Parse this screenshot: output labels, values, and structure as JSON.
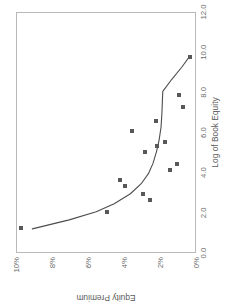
{
  "figure": {
    "orientation": "rotated-90-ccw",
    "background_color": "#ffffff",
    "frame_color": "#b9b9b9",
    "marker_color": "#585858",
    "line_color": "#4d4d4d"
  },
  "chart_data": {
    "type": "scatter",
    "title": "Smoothed Premium over CAPM vs. Unadjusted Premium over CAPM",
    "title_lines": [
      "Smoothed Premium over CAPM vs.",
      "Unadjusted Premium over CAPM"
    ],
    "xlabel": "Log of Book Equity",
    "ylabel": "Equity Premium",
    "xlim": [
      0.0,
      12.0
    ],
    "ylim": [
      0,
      10
    ],
    "xticks": [
      0.0,
      2.0,
      4.0,
      6.0,
      8.0,
      10.0,
      12.0
    ],
    "xtick_labels": [
      "0.0",
      "2.0",
      "4.0",
      "6.0",
      "8.0",
      "10.0",
      "12.0"
    ],
    "yticks": [
      0,
      2,
      4,
      6,
      8,
      10
    ],
    "ytick_labels": [
      "0%",
      "2%",
      "4%",
      "6%",
      "8%",
      "10%"
    ],
    "grid": false,
    "legend": null,
    "series": [
      {
        "name": "Unadjusted Premium over CAPM",
        "kind": "scatter",
        "marker": "square",
        "points": [
          {
            "x": 1.2,
            "y": 9.8
          },
          {
            "x": 2.0,
            "y": 5.0
          },
          {
            "x": 2.6,
            "y": 2.6
          },
          {
            "x": 2.9,
            "y": 3.0
          },
          {
            "x": 3.3,
            "y": 4.0
          },
          {
            "x": 3.6,
            "y": 4.3
          },
          {
            "x": 4.1,
            "y": 1.5
          },
          {
            "x": 4.4,
            "y": 1.1
          },
          {
            "x": 5.0,
            "y": 2.9
          },
          {
            "x": 5.3,
            "y": 2.2
          },
          {
            "x": 5.5,
            "y": 1.8
          },
          {
            "x": 6.0,
            "y": 3.6
          },
          {
            "x": 6.5,
            "y": 2.3
          },
          {
            "x": 7.2,
            "y": 0.8
          },
          {
            "x": 7.8,
            "y": 1.0
          },
          {
            "x": 9.7,
            "y": 0.4
          }
        ]
      },
      {
        "name": "Smoothed Premium over CAPM",
        "kind": "line",
        "points": [
          {
            "x": 1.15,
            "y": 9.15
          },
          {
            "x": 1.6,
            "y": 7.1
          },
          {
            "x": 2.0,
            "y": 5.6
          },
          {
            "x": 2.4,
            "y": 4.6
          },
          {
            "x": 2.9,
            "y": 3.7
          },
          {
            "x": 3.4,
            "y": 3.1
          },
          {
            "x": 3.9,
            "y": 2.7
          },
          {
            "x": 4.4,
            "y": 2.45
          },
          {
            "x": 5.0,
            "y": 2.25
          },
          {
            "x": 5.6,
            "y": 2.1
          },
          {
            "x": 6.2,
            "y": 2.0
          },
          {
            "x": 6.9,
            "y": 1.95
          },
          {
            "x": 7.6,
            "y": 1.92
          },
          {
            "x": 8.0,
            "y": 1.9
          },
          {
            "x": 8.6,
            "y": 1.4
          },
          {
            "x": 9.2,
            "y": 0.85
          },
          {
            "x": 9.75,
            "y": 0.4
          }
        ]
      }
    ]
  }
}
